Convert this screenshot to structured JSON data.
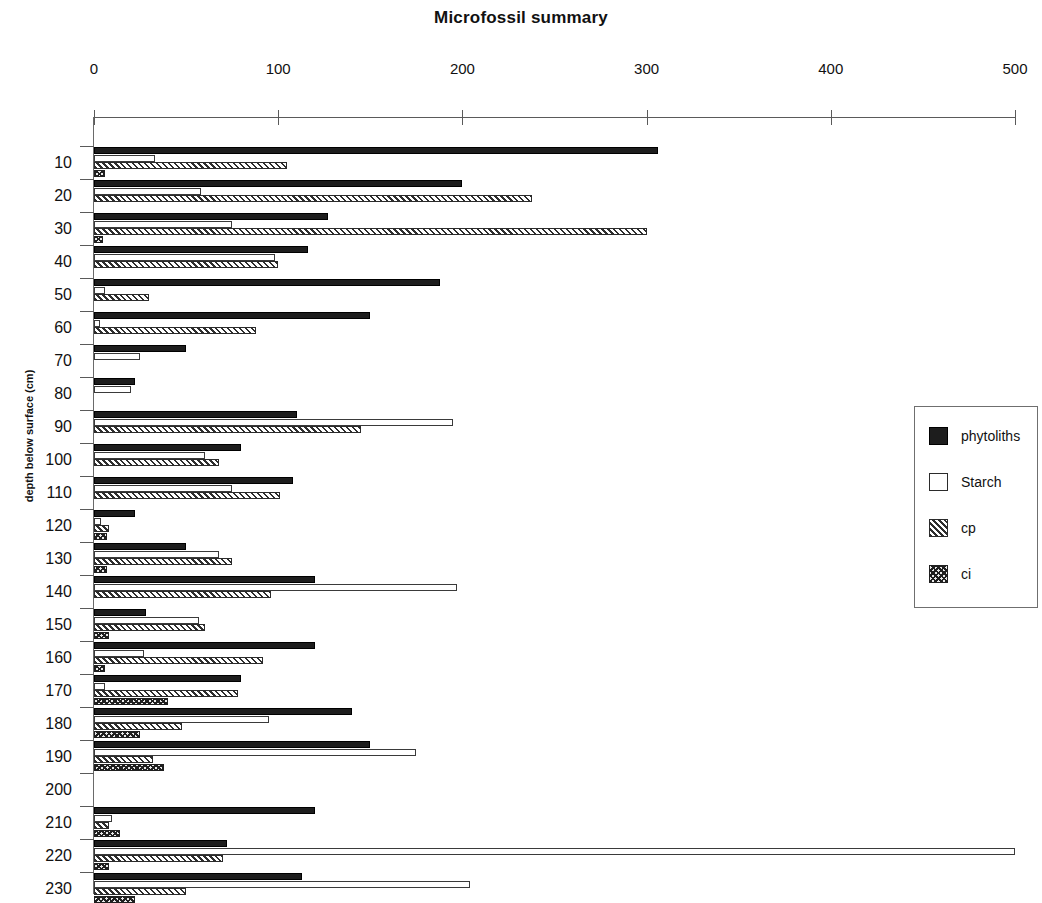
{
  "chart_data": {
    "type": "bar",
    "orientation": "horizontal",
    "title": "Microfossil summary",
    "xlabel": "",
    "ylabel": "depth below surface (cm)",
    "xlim": [
      0,
      500
    ],
    "xticks": [
      0,
      100,
      200,
      300,
      400,
      500
    ],
    "xtick_labels": [
      "0",
      "100",
      "200",
      "300",
      "400",
      "500"
    ],
    "grid": false,
    "legend_position": "right",
    "categories": [
      10,
      20,
      30,
      40,
      50,
      60,
      70,
      80,
      90,
      100,
      110,
      120,
      130,
      140,
      150,
      160,
      170,
      180,
      190,
      200,
      210,
      220,
      230
    ],
    "ytick_labels": [
      "10",
      "20",
      "30",
      "40",
      "50",
      "60",
      "70",
      "80",
      "90",
      "100",
      "110",
      "120",
      "130",
      "140",
      "150",
      "160",
      "170",
      "180",
      "190",
      "200",
      "210",
      "220",
      "230"
    ],
    "series": [
      {
        "name": "phytoliths",
        "color": "#1d1d1d",
        "fill": "solid",
        "values": [
          306,
          200,
          127,
          116,
          188,
          150,
          50,
          22,
          110,
          80,
          108,
          22,
          50,
          120,
          28,
          120,
          80,
          140,
          150,
          0,
          120,
          72,
          113
        ]
      },
      {
        "name": "Starch",
        "color": "#ffffff",
        "fill": "empty",
        "values": [
          33,
          58,
          75,
          98,
          6,
          3,
          25,
          20,
          195,
          60,
          75,
          4,
          68,
          197,
          57,
          27,
          6,
          95,
          175,
          0,
          10,
          500,
          204
        ]
      },
      {
        "name": "cp",
        "color": "#2e2e2e",
        "fill": "diagonal-hatch",
        "values": [
          105,
          238,
          300,
          100,
          30,
          88,
          0,
          0,
          145,
          68,
          101,
          8,
          75,
          96,
          60,
          92,
          78,
          48,
          32,
          0,
          8,
          70,
          50
        ]
      },
      {
        "name": "ci",
        "color": "#1f1f1f",
        "fill": "cross-hatch",
        "values": [
          6,
          0,
          5,
          0,
          0,
          0,
          0,
          0,
          0,
          0,
          0,
          7,
          7,
          0,
          8,
          6,
          40,
          25,
          38,
          0,
          14,
          8,
          22
        ]
      }
    ]
  },
  "legend": {
    "items": [
      {
        "label": "phytoliths",
        "swatch": "sw-phytoliths"
      },
      {
        "label": "Starch",
        "swatch": "sw-starch"
      },
      {
        "label": "cp",
        "swatch": "sw-cp"
      },
      {
        "label": "ci",
        "swatch": "sw-ci"
      }
    ]
  }
}
